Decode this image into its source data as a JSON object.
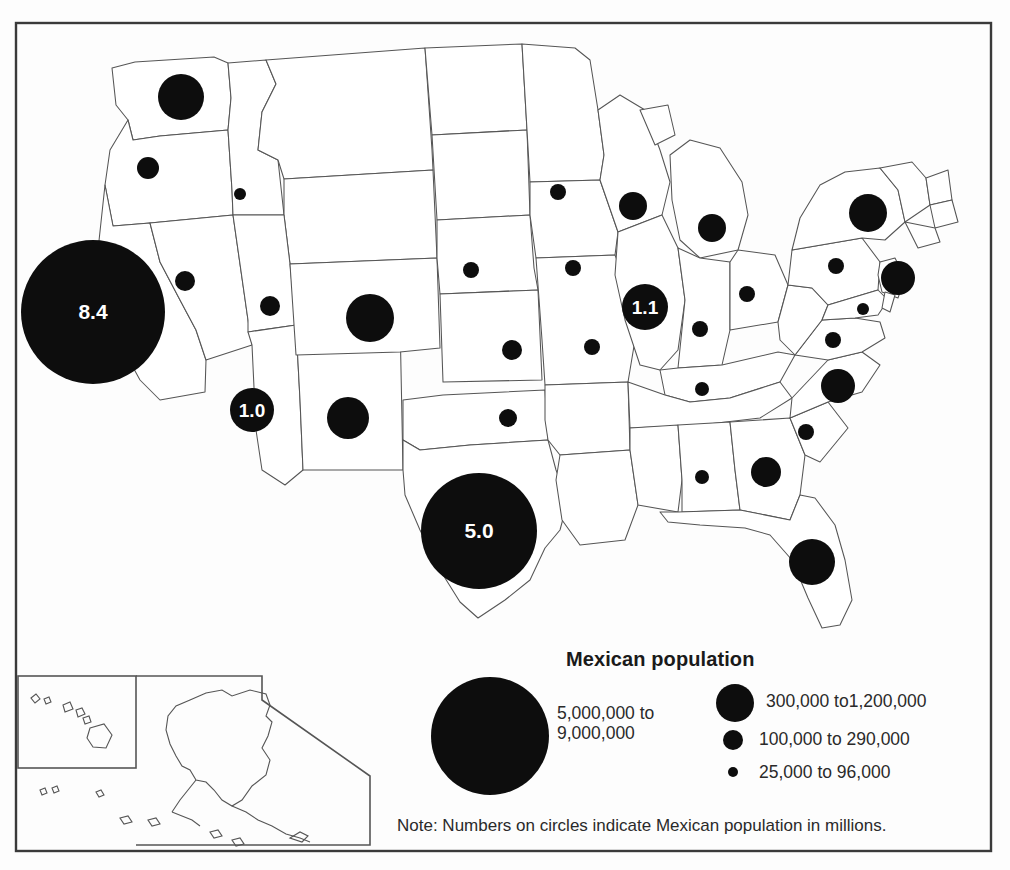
{
  "figure": {
    "title": "Mexican population",
    "note": "Note:  Numbers on circles indicate Mexican population in millions.",
    "frame_color": "#3a3a3a",
    "circle_color": "#0d0d0d",
    "outline_color": "#4a4a4a",
    "background": "#ffffff"
  },
  "legend": {
    "title": "Mexican population",
    "entries": [
      {
        "label_line1": "5,000,000 to",
        "label_line2": "9,000,000",
        "radius": 59,
        "value_min": 5000000,
        "value_max": 9000000
      },
      {
        "label_line1": "300,000 to1,200,000",
        "label_line2": "",
        "radius": 19,
        "value_min": 300000,
        "value_max": 1200000
      },
      {
        "label_line1": "100,000 to 290,000",
        "label_line2": "",
        "radius": 10,
        "value_min": 100000,
        "value_max": 290000
      },
      {
        "label_line1": "25,000 to 96,000",
        "label_line2": "",
        "radius": 5,
        "value_min": 25000,
        "value_max": 96000
      }
    ]
  },
  "chart_data": {
    "type": "bubble-map",
    "title": "Mexican population",
    "subtitle": "",
    "note": "Note:  Numbers on circles indicate Mexican population in millions.",
    "value_unit": "people",
    "label_unit": "millions",
    "legend_position": "bottom-center",
    "inset_regions": [
      "Hawaii",
      "Alaska"
    ],
    "size_classes": [
      {
        "label": "5,000,000 to 9,000,000",
        "radius": 59
      },
      {
        "label": "300,000 to1,200,000",
        "radius": 19
      },
      {
        "label": "100,000 to 290,000",
        "radius": 10
      },
      {
        "label": "25,000 to 96,000",
        "radius": 5
      }
    ],
    "points": [
      {
        "state": "California",
        "x": 93,
        "y": 312,
        "r": 72,
        "label": "8.4",
        "class": "5,000,000 to 9,000,000"
      },
      {
        "state": "Texas",
        "x": 479,
        "y": 531,
        "r": 58,
        "label": "5.0",
        "class": "5,000,000 to 9,000,000"
      },
      {
        "state": "Illinois",
        "x": 645,
        "y": 307,
        "r": 23,
        "label": "1.1",
        "class": "300,000 to1,200,000"
      },
      {
        "state": "Arizona",
        "x": 252,
        "y": 410,
        "r": 22,
        "label": "1.0",
        "class": "300,000 to1,200,000"
      },
      {
        "state": "Washington",
        "x": 181,
        "y": 97,
        "r": 23,
        "label": "",
        "class": "300,000 to1,200,000"
      },
      {
        "state": "Colorado",
        "x": 370,
        "y": 318,
        "r": 24,
        "label": "",
        "class": "300,000 to1,200,000"
      },
      {
        "state": "New Mexico",
        "x": 348,
        "y": 418,
        "r": 21,
        "label": "",
        "class": "300,000 to1,200,000"
      },
      {
        "state": "Florida",
        "x": 812,
        "y": 562,
        "r": 23,
        "label": "",
        "class": "300,000 to1,200,000"
      },
      {
        "state": "New York",
        "x": 868,
        "y": 213,
        "r": 19,
        "label": "",
        "class": "300,000 to1,200,000"
      },
      {
        "state": "New Jersey",
        "x": 898,
        "y": 278,
        "r": 17,
        "label": "",
        "class": "300,000 to1,200,000"
      },
      {
        "state": "North Carolina",
        "x": 838,
        "y": 386,
        "r": 17,
        "label": "",
        "class": "300,000 to1,200,000"
      },
      {
        "state": "Georgia",
        "x": 766,
        "y": 472,
        "r": 15,
        "label": "",
        "class": "300,000 to1,200,000"
      },
      {
        "state": "Wisconsin",
        "x": 633,
        "y": 206,
        "r": 14,
        "label": "",
        "class": "300,000 to1,200,000"
      },
      {
        "state": "Michigan",
        "x": 712,
        "y": 228,
        "r": 14,
        "label": "",
        "class": "300,000 to1,200,000"
      },
      {
        "state": "Oregon",
        "x": 148,
        "y": 168,
        "r": 11,
        "label": "",
        "class": "100,000 to 290,000"
      },
      {
        "state": "Nevada",
        "x": 185,
        "y": 281,
        "r": 10,
        "label": "",
        "class": "100,000 to 290,000"
      },
      {
        "state": "Utah",
        "x": 270,
        "y": 306,
        "r": 10,
        "label": "",
        "class": "100,000 to 290,000"
      },
      {
        "state": "Kansas",
        "x": 512,
        "y": 350,
        "r": 10,
        "label": "",
        "class": "100,000 to 290,000"
      },
      {
        "state": "Oklahoma",
        "x": 508,
        "y": 418,
        "r": 9,
        "label": "",
        "class": "100,000 to 290,000"
      },
      {
        "state": "Nebraska",
        "x": 471,
        "y": 270,
        "r": 8,
        "label": "",
        "class": "100,000 to 290,000"
      },
      {
        "state": "Minnesota",
        "x": 558,
        "y": 192,
        "r": 8,
        "label": "",
        "class": "100,000 to 290,000"
      },
      {
        "state": "Iowa",
        "x": 573,
        "y": 268,
        "r": 8,
        "label": "",
        "class": "100,000 to 290,000"
      },
      {
        "state": "Missouri",
        "x": 592,
        "y": 347,
        "r": 8,
        "label": "",
        "class": "100,000 to 290,000"
      },
      {
        "state": "Indiana",
        "x": 700,
        "y": 329,
        "r": 8,
        "label": "",
        "class": "100,000 to 290,000"
      },
      {
        "state": "Ohio",
        "x": 747,
        "y": 294,
        "r": 8,
        "label": "",
        "class": "100,000 to 290,000"
      },
      {
        "state": "Pennsylvania",
        "x": 836,
        "y": 266,
        "r": 8,
        "label": "",
        "class": "100,000 to 290,000"
      },
      {
        "state": "Virginia",
        "x": 833,
        "y": 340,
        "r": 8,
        "label": "",
        "class": "100,000 to 290,000"
      },
      {
        "state": "Tennessee",
        "x": 702,
        "y": 389,
        "r": 7,
        "label": "",
        "class": "25,000 to 96,000"
      },
      {
        "state": "South Carolina",
        "x": 806,
        "y": 432,
        "r": 8,
        "label": "",
        "class": "25,000 to 96,000"
      },
      {
        "state": "Alabama",
        "x": 702,
        "y": 477,
        "r": 7,
        "label": "",
        "class": "25,000 to 96,000"
      },
      {
        "state": "Idaho",
        "x": 240,
        "y": 194,
        "r": 6,
        "label": "",
        "class": "25,000 to 96,000"
      },
      {
        "state": "Maryland",
        "x": 863,
        "y": 309,
        "r": 6,
        "label": "",
        "class": "25,000 to 96,000"
      }
    ]
  }
}
